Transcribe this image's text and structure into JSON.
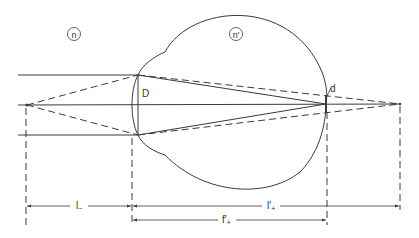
{
  "diagram": {
    "type": "optics-ray-diagram",
    "colors": {
      "line": "#3a3a3a",
      "background": "#ffffff"
    },
    "media_labels": {
      "outside": "n",
      "inside": "n'"
    },
    "point_labels": {
      "pupil_diameter": "D",
      "blur_spot": "d"
    },
    "dimensions": {
      "object_distance": {
        "main": "l",
        "sub": "−"
      },
      "image_distance": {
        "main": "l'",
        "sub": "+"
      },
      "focal_length": {
        "main": "f'",
        "sub": "+"
      }
    }
  }
}
